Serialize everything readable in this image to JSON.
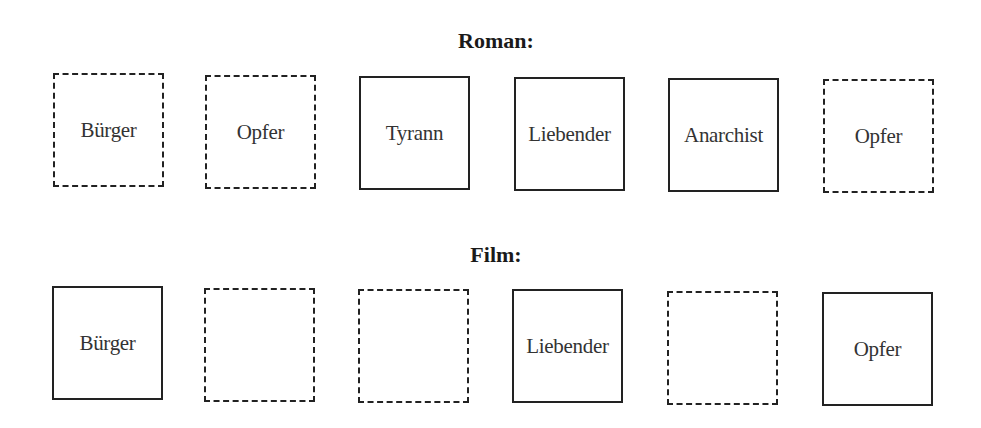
{
  "diagram": {
    "rows": [
      {
        "title": "Roman:",
        "boxes": [
          {
            "label": "Bürger",
            "style": "dashed"
          },
          {
            "label": "Opfer",
            "style": "dashed"
          },
          {
            "label": "Tyrann",
            "style": "solid"
          },
          {
            "label": "Liebender",
            "style": "solid"
          },
          {
            "label": "Anarchist",
            "style": "solid"
          },
          {
            "label": "Opfer",
            "style": "dashed"
          }
        ]
      },
      {
        "title": "Film:",
        "boxes": [
          {
            "label": "Bürger",
            "style": "solid"
          },
          {
            "label": "",
            "style": "dashed"
          },
          {
            "label": "",
            "style": "dashed"
          },
          {
            "label": "Liebender",
            "style": "solid"
          },
          {
            "label": "",
            "style": "dashed"
          },
          {
            "label": "Opfer",
            "style": "solid"
          }
        ]
      }
    ],
    "colors": {
      "border": "#222222",
      "text": "#333333",
      "background": "#ffffff"
    }
  }
}
